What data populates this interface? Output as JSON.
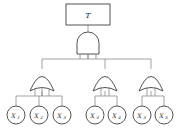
{
  "diagram": {
    "type": "fault-tree",
    "title_text": "",
    "colors": {
      "background": "#ffffff",
      "outline": "#404040",
      "wire": "#8a8a8a",
      "text": "#2b2b2b",
      "fill": "#ffffff"
    },
    "top_event": {
      "label": "T",
      "shape": "rectangle",
      "x": 88,
      "y": 14
    },
    "gates": [
      {
        "id": "gate-top-and",
        "gate_type": "AND",
        "label": "",
        "x": 88,
        "y": 43,
        "inputs": [
          "gate-or-left",
          "gate-or-middle",
          "gate-or-right"
        ],
        "output": "top_event"
      },
      {
        "id": "gate-or-left",
        "gate_type": "OR",
        "label": "",
        "x": 42,
        "y": 80,
        "inputs": [
          "leaf-1",
          "leaf-2",
          "leaf-3"
        ],
        "output": "gate-top-and"
      },
      {
        "id": "gate-or-middle",
        "gate_type": "OR",
        "label": "",
        "x": 105,
        "y": 80,
        "inputs": [
          "leaf-4",
          "leaf-5"
        ],
        "output": "gate-top-and"
      },
      {
        "id": "gate-or-right",
        "gate_type": "OR",
        "label": "",
        "x": 151,
        "y": 80,
        "inputs": [
          "leaf-6",
          "leaf-7"
        ],
        "output": "gate-top-and"
      }
    ],
    "basic_events": [
      {
        "id": "leaf-1",
        "base": "X",
        "subscript": "1",
        "label": "X1",
        "x": 16,
        "y": 115,
        "parent": "gate-or-left"
      },
      {
        "id": "leaf-2",
        "base": "X",
        "subscript": "2",
        "label": "X2",
        "x": 39,
        "y": 115,
        "parent": "gate-or-left"
      },
      {
        "id": "leaf-3",
        "base": "X",
        "subscript": "3",
        "label": "X3",
        "x": 62,
        "y": 115,
        "parent": "gate-or-left"
      },
      {
        "id": "leaf-4",
        "base": "X",
        "subscript": "3",
        "label": "X3",
        "x": 95,
        "y": 115,
        "parent": "gate-or-middle"
      },
      {
        "id": "leaf-5",
        "base": "X",
        "subscript": "4",
        "label": "X4",
        "x": 117,
        "y": 115,
        "parent": "gate-or-middle"
      },
      {
        "id": "leaf-6",
        "base": "X",
        "subscript": "3",
        "label": "X3",
        "x": 142,
        "y": 115,
        "parent": "gate-or-right"
      },
      {
        "id": "leaf-7",
        "base": "X",
        "subscript": "5",
        "label": "X5",
        "x": 164,
        "y": 115,
        "parent": "gate-or-right"
      }
    ]
  }
}
